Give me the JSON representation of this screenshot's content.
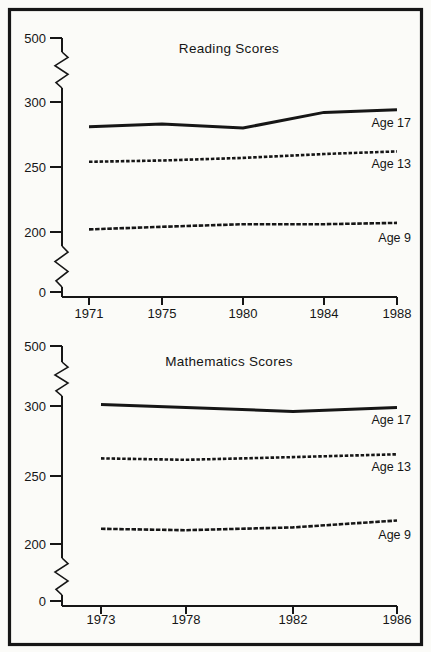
{
  "style": {
    "ink_color": "#161616",
    "paper_color": "#fbfbf8"
  },
  "chart_data": [
    {
      "type": "line",
      "title": "Reading Scores",
      "xlabel": "",
      "ylabel": "",
      "ylim": [
        0,
        500
      ],
      "y_ticks": [
        500,
        300,
        250,
        200,
        0
      ],
      "axis_break": "zigzag breaks between 0-200 and 300-500",
      "grid": false,
      "legend_position": "labels right of line ends",
      "x": [
        1971,
        1975,
        1980,
        1984,
        1988
      ],
      "series": [
        {
          "name": "Age 17",
          "line_style": "solid",
          "values": [
            281,
            283,
            280,
            292,
            294
          ]
        },
        {
          "name": "Age 13",
          "line_style": "dashed",
          "values": [
            254,
            255,
            257,
            260,
            262
          ]
        },
        {
          "name": "Age 9",
          "line_style": "dashed",
          "values": [
            202,
            204,
            206,
            206,
            207
          ]
        }
      ]
    },
    {
      "type": "line",
      "title": "Mathematics Scores",
      "xlabel": "",
      "ylabel": "",
      "ylim": [
        0,
        500
      ],
      "y_ticks": [
        500,
        300,
        250,
        200,
        0
      ],
      "axis_break": "zigzag breaks between 0-200 and 300-500",
      "grid": false,
      "legend_position": "labels right of line ends",
      "x": [
        1973,
        1978,
        1982,
        1986
      ],
      "series": [
        {
          "name": "Age 17",
          "line_style": "solid",
          "values": [
            301,
            299,
            296,
            299
          ]
        },
        {
          "name": "Age 13",
          "line_style": "dashed",
          "values": [
            262,
            261,
            263,
            265
          ]
        },
        {
          "name": "Age 9",
          "line_style": "dashed",
          "values": [
            211,
            210,
            212,
            217
          ]
        }
      ]
    }
  ]
}
